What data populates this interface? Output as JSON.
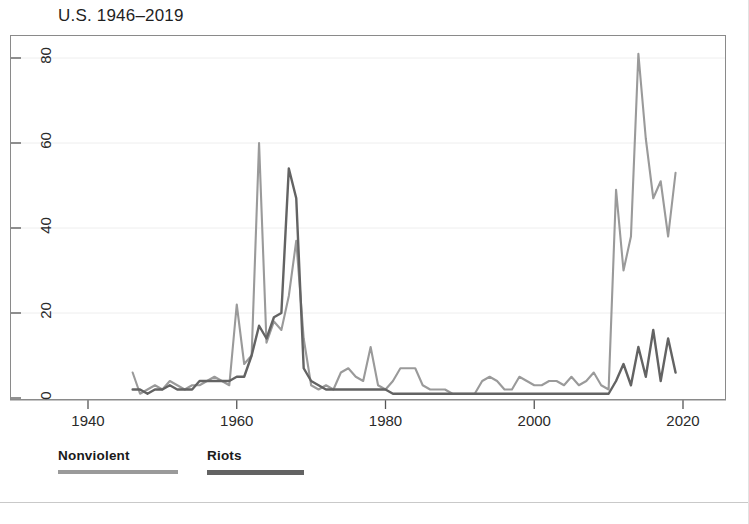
{
  "chart_data": {
    "type": "line",
    "title": "U.S. 1946–2019",
    "xlabel": "",
    "ylabel": "",
    "xlim": [
      1940,
      2022
    ],
    "ylim": [
      0,
      85
    ],
    "xticks": [
      1940,
      1960,
      1980,
      2000,
      2020
    ],
    "yticks": [
      0,
      20,
      40,
      60,
      80
    ],
    "grid": "horizontal-gridlines-light",
    "legend_position": "below-plot-left",
    "x": [
      1946,
      1947,
      1948,
      1949,
      1950,
      1951,
      1952,
      1953,
      1954,
      1955,
      1956,
      1957,
      1958,
      1959,
      1960,
      1961,
      1962,
      1963,
      1964,
      1965,
      1966,
      1967,
      1968,
      1969,
      1970,
      1971,
      1972,
      1973,
      1974,
      1975,
      1976,
      1977,
      1978,
      1979,
      1980,
      1981,
      1982,
      1983,
      1984,
      1985,
      1986,
      1987,
      1988,
      1989,
      1990,
      1991,
      1992,
      1993,
      1994,
      1995,
      1996,
      1997,
      1998,
      1999,
      2000,
      2001,
      2002,
      2003,
      2004,
      2005,
      2006,
      2007,
      2008,
      2009,
      2010,
      2011,
      2012,
      2013,
      2014,
      2015,
      2016,
      2017,
      2018,
      2019
    ],
    "series": [
      {
        "name": "Nonviolent",
        "color": "#9a9a9a",
        "values": [
          6,
          1,
          2,
          3,
          2,
          4,
          3,
          2,
          3,
          3,
          4,
          5,
          4,
          3,
          22,
          8,
          10,
          60,
          13,
          18,
          16,
          24,
          37,
          14,
          3,
          2,
          3,
          2,
          6,
          7,
          5,
          4,
          12,
          3,
          2,
          4,
          7,
          7,
          7,
          3,
          2,
          2,
          2,
          1,
          1,
          1,
          1,
          4,
          5,
          4,
          2,
          2,
          5,
          4,
          3,
          3,
          4,
          4,
          3,
          5,
          3,
          4,
          6,
          3,
          2,
          49,
          30,
          38,
          81,
          61,
          47,
          51,
          38,
          53
        ]
      },
      {
        "name": "Riots",
        "color": "#636363",
        "values": [
          2,
          2,
          1,
          2,
          2,
          3,
          2,
          2,
          2,
          4,
          4,
          4,
          4,
          4,
          5,
          5,
          10,
          17,
          14,
          19,
          20,
          54,
          47,
          7,
          4,
          3,
          2,
          2,
          2,
          2,
          2,
          2,
          2,
          2,
          2,
          1,
          1,
          1,
          1,
          1,
          1,
          1,
          1,
          1,
          1,
          1,
          1,
          1,
          1,
          1,
          1,
          1,
          1,
          1,
          1,
          1,
          1,
          1,
          1,
          1,
          1,
          1,
          1,
          1,
          1,
          4,
          8,
          3,
          12,
          5,
          16,
          4,
          14,
          6
        ]
      }
    ]
  },
  "legend": {
    "entries": [
      {
        "label": "Nonviolent",
        "color": "#9a9a9a"
      },
      {
        "label": "Riots",
        "color": "#636363"
      }
    ]
  },
  "axes": {
    "y_tick_labels": [
      "0",
      "20",
      "40",
      "60",
      "80"
    ],
    "x_tick_labels": [
      "1940",
      "1960",
      "1980",
      "2000",
      "2020"
    ]
  }
}
